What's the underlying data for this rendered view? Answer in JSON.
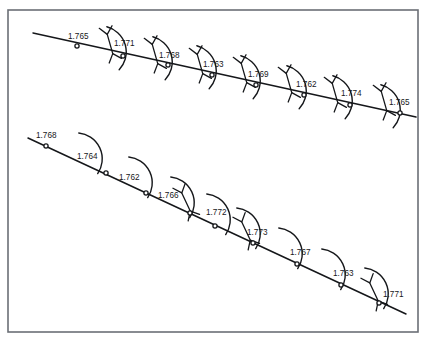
{
  "figure": {
    "title": "",
    "background_color": "#ffffff",
    "ink_color": "#15171a",
    "frame": {
      "name": "image-border-frame",
      "x": 8,
      "y": 10,
      "width": 410,
      "height": 322,
      "stroke": "#6b6f76",
      "stroke_width": 1.6
    },
    "label_font_size_px": 8.2,
    "marker_style": "open-circle",
    "marker_radius": 2.1
  },
  "chart_data": {
    "type": "scatter",
    "title": "",
    "xlabel": "",
    "ylabel": "",
    "legend": "none",
    "grid": false,
    "series": [
      {
        "name": "traverse-line-upper",
        "line": {
          "x1": 33,
          "y1": 33,
          "x2": 416,
          "y2": 117
        },
        "points": [
          {
            "label": "1.765",
            "x": 77,
            "y": 46,
            "label_x": 68,
            "label_y": 39
          },
          {
            "label": "1.771",
            "x": 123,
            "y": 56,
            "label_x": 114,
            "label_y": 46
          },
          {
            "label": "1.768",
            "x": 168,
            "y": 65,
            "label_x": 159,
            "label_y": 58
          },
          {
            "label": "1.763",
            "x": 212,
            "y": 75,
            "label_x": 203,
            "label_y": 67
          },
          {
            "label": "1.769",
            "x": 256,
            "y": 85,
            "label_x": 248,
            "label_y": 77
          },
          {
            "label": "1.762",
            "x": 304,
            "y": 95,
            "label_x": 296,
            "label_y": 87
          },
          {
            "label": "1.774",
            "x": 350,
            "y": 105,
            "label_x": 341,
            "label_y": 96
          },
          {
            "label": "1.765",
            "x": 400,
            "y": 113,
            "label_x": 389,
            "label_y": 105
          }
        ]
      },
      {
        "name": "traverse-line-lower",
        "line": {
          "x1": 28,
          "y1": 138,
          "x2": 406,
          "y2": 314
        },
        "points": [
          {
            "label": "1.768",
            "x": 46,
            "y": 146,
            "label_x": 36,
            "label_y": 138
          },
          {
            "label": "1.764",
            "x": 106,
            "y": 173,
            "label_x": 77,
            "label_y": 159
          },
          {
            "label": "1.762",
            "x": 146,
            "y": 193,
            "label_x": 119,
            "label_y": 180
          },
          {
            "label": "1.766",
            "x": 190,
            "y": 213,
            "label_x": 158,
            "label_y": 198
          },
          {
            "label": "1.772",
            "x": 215,
            "y": 226,
            "label_x": 206,
            "label_y": 215
          },
          {
            "label": "1.773",
            "x": 253,
            "y": 243,
            "label_x": 247,
            "label_y": 235
          },
          {
            "label": "1.767",
            "x": 297,
            "y": 264,
            "label_x": 290,
            "label_y": 255
          },
          {
            "label": "1.763",
            "x": 341,
            "y": 285,
            "label_x": 333,
            "label_y": 276
          },
          {
            "label": "1.771",
            "x": 379,
            "y": 303,
            "label_x": 383,
            "label_y": 297
          }
        ]
      }
    ],
    "annotations": {
      "arc_symbols_upper": [
        {
          "cx": 100,
          "cy": 52,
          "rotate": -16
        },
        {
          "cx": 146,
          "cy": 62,
          "rotate": -16
        },
        {
          "cx": 190,
          "cy": 71,
          "rotate": -16
        },
        {
          "cx": 234,
          "cy": 81,
          "rotate": -16
        },
        {
          "cx": 280,
          "cy": 91,
          "rotate": -16
        },
        {
          "cx": 326,
          "cy": 101,
          "rotate": -16
        },
        {
          "cx": 374,
          "cy": 110,
          "rotate": -16
        }
      ],
      "fork_ticks_upper": [
        {
          "cx": 110,
          "cy": 44,
          "rotate": -16
        },
        {
          "cx": 155,
          "cy": 54,
          "rotate": -16
        },
        {
          "cx": 200,
          "cy": 64,
          "rotate": -16
        },
        {
          "cx": 244,
          "cy": 73,
          "rotate": -16
        },
        {
          "cx": 289,
          "cy": 83,
          "rotate": -16
        },
        {
          "cx": 335,
          "cy": 93,
          "rotate": -16
        },
        {
          "cx": 384,
          "cy": 101,
          "rotate": -16
        }
      ],
      "arc_symbols_lower": [
        {
          "cx": 76,
          "cy": 159,
          "rotate": -25
        },
        {
          "cx": 126,
          "cy": 183,
          "rotate": -25
        },
        {
          "cx": 168,
          "cy": 203,
          "rotate": -25
        },
        {
          "cx": 204,
          "cy": 220,
          "rotate": -25
        },
        {
          "cx": 234,
          "cy": 234,
          "rotate": -25
        },
        {
          "cx": 276,
          "cy": 254,
          "rotate": -25
        },
        {
          "cx": 319,
          "cy": 275,
          "rotate": -25
        },
        {
          "cx": 362,
          "cy": 294,
          "rotate": -25
        }
      ],
      "fork_ticks_lower": [
        {
          "cx": 186,
          "cy": 202,
          "rotate": -25
        },
        {
          "cx": 246,
          "cy": 231,
          "rotate": -25
        },
        {
          "cx": 374,
          "cy": 292,
          "rotate": -25
        }
      ]
    }
  }
}
